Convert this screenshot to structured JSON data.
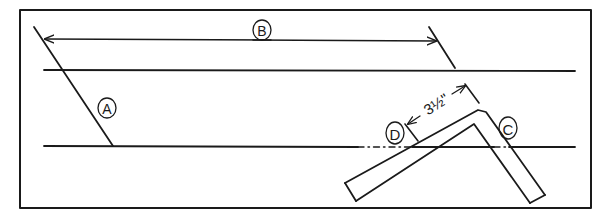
{
  "diagram": {
    "stroke_color": "#1a1a1a",
    "background_color": "#ffffff",
    "labels": [
      {
        "id": "A",
        "text": "A",
        "cx": 107,
        "cy": 108
      },
      {
        "id": "B",
        "text": "B",
        "cx": 262,
        "cy": 30
      },
      {
        "id": "C",
        "text": "C",
        "cx": 508,
        "cy": 128
      },
      {
        "id": "D",
        "text": "D",
        "cx": 395,
        "cy": 135
      }
    ],
    "dimension": {
      "text": "3½\"",
      "whole": "3",
      "fraction": "1/2",
      "unit": "\""
    }
  }
}
